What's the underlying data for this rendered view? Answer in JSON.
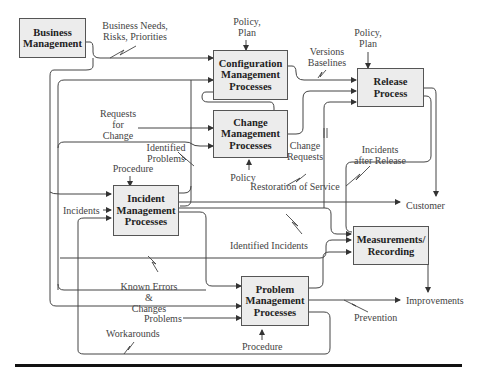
{
  "diagram": {
    "boxes": {
      "business_management": "Business\nManagement",
      "configuration_management": "Configuration\nManagement\nProcesses",
      "change_management": "Change\nManagement\nProcesses",
      "release_process": "Release\nProcess",
      "incident_management": "Incident\nManagement\nProcesses",
      "measurements_recording": "Measurements/\nRecording",
      "problem_management": "Problem\nManagement\nProcesses"
    },
    "labels": {
      "business_needs": "Business Needs,\nRisks, Priorities",
      "policy_plan_config": "Policy,\nPlan",
      "policy_plan_release": "Policy,\nPlan",
      "versions_baselines": "Versions\nBaselines",
      "requests_for_change": "Requests\nfor\nChange",
      "identified_problems": "Identified\nProblems",
      "change_requests": "Change\nRequests",
      "incidents_after_release": "Incidents\nafter Release",
      "procedure_incident": "Procedure",
      "policy_change": "Policy",
      "restoration_of_service": "Restoration of Service",
      "incidents": "Incidents",
      "customer": "Customer",
      "identified_incidents": "Identified Incidents",
      "known_errors_changes": "Known Errors &\nChanges",
      "improvements": "Improvements",
      "problems": "Problems",
      "prevention": "Prevention",
      "workarounds": "Workarounds",
      "procedure_problem": "Procedure"
    }
  }
}
